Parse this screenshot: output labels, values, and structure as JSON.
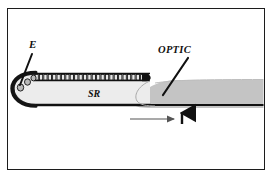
{
  "figure": {
    "background_color": "#ffffff",
    "frame": {
      "name": "figure-border",
      "color": "#1c1c1c",
      "x": 7,
      "y": 8,
      "width": 258,
      "height": 162
    },
    "labels": [
      {
        "id": "e",
        "text": "E",
        "meaning": "epithelium",
        "x": 29,
        "y": 48,
        "style": "bold-italic-serif",
        "color": "#111111"
      },
      {
        "id": "optic",
        "text": "OPTIC",
        "meaning": "optic zone",
        "x": 158,
        "y": 53,
        "style": "bold-italic-serif",
        "color": "#111111"
      },
      {
        "id": "sr",
        "text": "SR",
        "meaning": "subcapsular region",
        "x": 88,
        "y": 97,
        "style": "bold-italic-serif",
        "color": "#111111"
      }
    ],
    "leader_lines": [
      {
        "id": "e-leader",
        "from_label": "E",
        "x1": 32,
        "y1": 54,
        "x2": 20,
        "y2": 85,
        "color": "#111111",
        "width": 2
      },
      {
        "id": "optic-leader",
        "from_label": "OPTIC",
        "x1": 188,
        "y1": 58,
        "x2": 163,
        "y2": 95,
        "color": "#111111",
        "width": 2
      }
    ],
    "shapes": [
      {
        "id": "subcapsular-region",
        "label_ref": "SR",
        "fill": "#ececec",
        "stroke": "#1a1a1a",
        "description": "elongated capsule with rounded left tip extending right"
      },
      {
        "id": "optic-wedge",
        "label_ref": "OPTIC",
        "fill": "#c4c4c4",
        "stroke": "none",
        "description": "medium gray tongue-shaped mass overlapping right portion and running to frame edge"
      },
      {
        "id": "epithelium-cell-row",
        "label_ref": "E",
        "fill": "#e8e8e8",
        "stroke": "#111111",
        "cell_count": 26,
        "description": "row of small rectangular cells along the upper boundary"
      },
      {
        "id": "tip-cells",
        "fill": "#bdbdbd",
        "stroke": "#111111",
        "cell_count": 3,
        "description": "small rounded cells at the curved left tip"
      },
      {
        "id": "basal-line",
        "stroke": "#111111",
        "description": "thick dark line along the lower boundary continuing to the right edge"
      }
    ],
    "arrows": [
      {
        "id": "growth-direction-arrow",
        "orientation": "horizontal",
        "direction": "right",
        "x1": 130,
        "y1": 119,
        "x2": 176,
        "y2": 119,
        "color": "#555555"
      },
      {
        "id": "equator-marker-arrow",
        "orientation": "vertical",
        "direction": "up",
        "x1": 182,
        "y1": 124,
        "x2": 182,
        "y2": 110,
        "color": "#111111"
      }
    ]
  }
}
